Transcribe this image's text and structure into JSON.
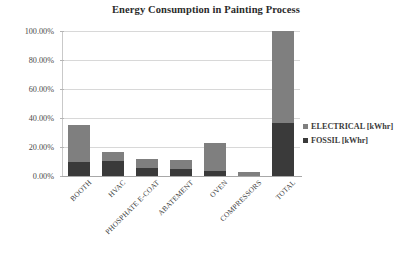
{
  "chart_data": {
    "type": "bar",
    "subtype": "stacked-column",
    "title": "Energy Consumption in Painting Process",
    "xlabel": "",
    "ylabel": "",
    "categories": [
      "BOOTH",
      "HVAC",
      "PHOSPHATE E-COAT",
      "ABATEMENT",
      "OVEN",
      "COMPRESSORS",
      "TOTAL"
    ],
    "series": [
      {
        "name": "FOSSIL [kWhr]",
        "color": "#3a3a3a",
        "values": [
          9.5,
          10.5,
          5.5,
          4.5,
          3.5,
          0.0,
          36.5
        ]
      },
      {
        "name": "ELECTRICAL [kWhr]",
        "color": "#7f7f7f",
        "values": [
          25.5,
          6.0,
          6.0,
          6.5,
          19.0,
          3.0,
          63.5
        ]
      }
    ],
    "stack_totals": [
      35.0,
      16.5,
      11.5,
      11.0,
      22.5,
      3.0,
      100.0
    ],
    "ylim": [
      0,
      100
    ],
    "yticks": [
      0,
      20,
      40,
      60,
      80,
      100
    ],
    "ytick_labels": [
      "0.00%",
      "20.00%",
      "40.00%",
      "60.00%",
      "80.00%",
      "100.00%"
    ],
    "grid": true,
    "grid_axis": "y",
    "legend_position": "right",
    "value_format": "percent"
  },
  "legend": {
    "items": [
      {
        "label": "ELECTRICAL [kWhr]",
        "color": "#7f7f7f"
      },
      {
        "label": "FOSSIL [kWhr]",
        "color": "#3a3a3a"
      }
    ]
  }
}
